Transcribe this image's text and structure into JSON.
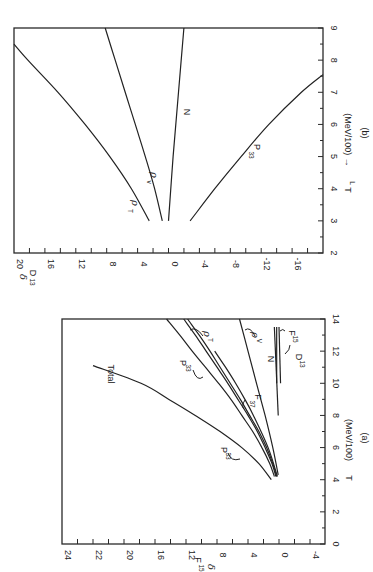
{
  "figure": {
    "orientation": "rotated 90deg counter-clockwise",
    "background": "#ffffff",
    "ink": "#222222"
  },
  "chart_data": [
    {
      "id": "a",
      "type": "line",
      "caption": "(a)",
      "title": "",
      "xlabel": "T  (MeV/100)",
      "ylabel": "δ F15",
      "xlim": [
        0,
        14
      ],
      "x_ticks": [
        0,
        2,
        4,
        6,
        8,
        10,
        12,
        14
      ],
      "y_tick_labels": [
        "24",
        "22",
        "20",
        "16",
        "12",
        "8",
        "4",
        "0",
        "-4"
      ],
      "ylim": [
        -6,
        24
      ],
      "grid": false,
      "series": [
        {
          "name": "Total",
          "x": [
            4,
            5,
            6,
            7,
            8,
            9,
            10,
            11.1
          ],
          "y": [
            1,
            2.6,
            4.8,
            7.6,
            10.8,
            14.2,
            17.8,
            24
          ]
        },
        {
          "name": "P33",
          "x": [
            4.2,
            5,
            6,
            7,
            8,
            9,
            10,
            11,
            12,
            13,
            14
          ],
          "y": [
            0.6,
            1.2,
            2.2,
            3.4,
            4.8,
            6.2,
            7.8,
            9.5,
            11.2,
            12.8,
            14.5
          ]
        },
        {
          "name": "P33 (inner)",
          "x": [
            4.2,
            5,
            6,
            7,
            8,
            9,
            10,
            11,
            12,
            13,
            14
          ],
          "y": [
            0.4,
            0.9,
            1.8,
            2.8,
            4.0,
            5.3,
            6.6,
            8.0,
            9.4,
            10.8,
            12.3
          ]
        },
        {
          "name": "ρT",
          "x": [
            4.2,
            5,
            6,
            7,
            8,
            9,
            10,
            11,
            12,
            13,
            14
          ],
          "y": [
            0.3,
            0.8,
            1.6,
            2.6,
            3.8,
            5.0,
            6.3,
            7.6,
            8.9,
            10.3,
            11.8
          ]
        },
        {
          "name": "F37",
          "x": [
            4.2,
            6,
            8,
            9,
            10,
            11,
            12
          ],
          "y": [
            0.2,
            1.4,
            3.3,
            4.4,
            5.6,
            6.9,
            8.3
          ]
        },
        {
          "name": "N / ρV",
          "x": [
            4.3,
            6,
            8,
            10,
            12,
            14
          ],
          "y": [
            0.1,
            0.8,
            1.8,
            2.9,
            4.0,
            5.1
          ]
        },
        {
          "name": "D13",
          "x": [
            8,
            13.5
          ],
          "y": [
            0.1,
            0.6
          ]
        },
        {
          "name": "F15",
          "x": [
            10,
            13.5
          ],
          "y": [
            -0.2,
            0.0
          ]
        }
      ],
      "annotations": [
        "Total",
        "P33",
        "P33",
        "ρT",
        "F37",
        "ρV",
        "N",
        "D13",
        "F15"
      ]
    },
    {
      "id": "b",
      "type": "line",
      "caption": "(b)",
      "title": "",
      "xlabel": "TL  (MeV/100) →",
      "ylabel": "δ D13",
      "xlim": [
        2,
        9
      ],
      "x_ticks": [
        2,
        3,
        4,
        5,
        6,
        7,
        8,
        9
      ],
      "y_tick_labels": [
        "20",
        "16",
        "12",
        "8",
        "4",
        "0",
        "-4",
        "-8",
        "-12",
        "-16"
      ],
      "ylim": [
        -20,
        20
      ],
      "grid": false,
      "series": [
        {
          "name": "ρT",
          "x": [
            3,
            4,
            5,
            6,
            7,
            8,
            8.5
          ],
          "y": [
            2.5,
            4.8,
            7.6,
            10.8,
            14.3,
            18.2,
            20
          ]
        },
        {
          "name": "ρV",
          "x": [
            3,
            4,
            5,
            6,
            7,
            8,
            9
          ],
          "y": [
            0.8,
            1.8,
            3.0,
            4.3,
            5.6,
            6.9,
            8.2
          ]
        },
        {
          "name": "N",
          "x": [
            3,
            5,
            7,
            9
          ],
          "y": [
            0.0,
            -0.6,
            -1.3,
            -2.0
          ]
        },
        {
          "name": "P33",
          "x": [
            3,
            4,
            5,
            6,
            7,
            7.55
          ],
          "y": [
            -2.8,
            -6.0,
            -9.4,
            -13.0,
            -17.2,
            -20
          ]
        }
      ],
      "annotations": [
        "ρT",
        "ρv",
        "N",
        "P33"
      ]
    }
  ],
  "labels": {
    "a_caption": "(a)",
    "a_xlabel": "T  (MeV/100)",
    "a_ylabel_delta": "δ",
    "a_ylabel_sub": "F15",
    "b_caption": "(b)",
    "b_xlabel": "TL  (MeV/IOO) →",
    "b_xlabel_T": "T",
    "b_xlabel_sub": "L",
    "b_xlabel_rest": "(MeV/100) →",
    "b_ylabel_delta": "δ",
    "b_ylabel_sub": "D13"
  }
}
